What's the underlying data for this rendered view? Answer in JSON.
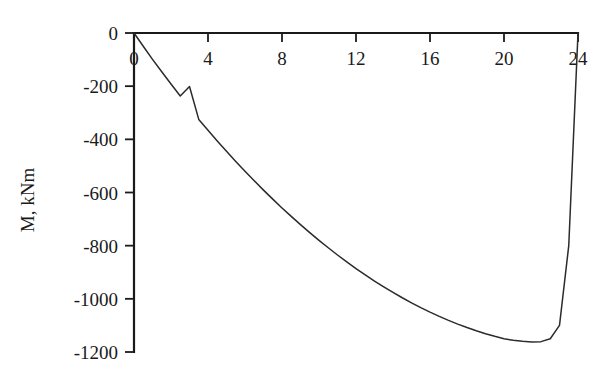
{
  "chart_data": {
    "type": "line",
    "title": "",
    "xlabel": "",
    "ylabel": "M, kNm",
    "xlim": [
      0,
      24
    ],
    "ylim": [
      -1200,
      0
    ],
    "grid": false,
    "legend": null,
    "xticks": [
      "0",
      "4",
      "8",
      "12",
      "16",
      "20",
      "24"
    ],
    "xtick_values": [
      0,
      4,
      8,
      12,
      16,
      20,
      24
    ],
    "yticks": [
      "0",
      "-200",
      "-400",
      "-600",
      "-800",
      "-1000",
      "-1200"
    ],
    "ytick_values": [
      0,
      -200,
      -400,
      -600,
      -800,
      -1000,
      -1200
    ],
    "series": [
      {
        "name": "Bending moment",
        "color": "#2b2b2b",
        "x": [
          0,
          0.5,
          1,
          1.5,
          2,
          2.5,
          3,
          3.5,
          4,
          4.5,
          5,
          5.5,
          6,
          6.5,
          7,
          7.5,
          8,
          8.5,
          9,
          9.5,
          10,
          10.5,
          11,
          11.5,
          12,
          12.5,
          13,
          13.5,
          14,
          14.5,
          15,
          15.5,
          16,
          16.5,
          17,
          17.5,
          18,
          18.5,
          19,
          19.5,
          20,
          20.5,
          21,
          21.5,
          22,
          22.5,
          23,
          23.5,
          24
        ],
        "y": [
          0,
          -50,
          -99,
          -146,
          -192,
          -237,
          -201,
          -325,
          -366,
          -406,
          -445,
          -483,
          -520,
          -556,
          -591,
          -625,
          -658,
          -690,
          -721,
          -751,
          -780,
          -808,
          -835,
          -861,
          -886,
          -910,
          -933,
          -955,
          -976,
          -996,
          -1015,
          -1033,
          -1050,
          -1066,
          -1081,
          -1095,
          -1108,
          -1120,
          -1131,
          -1141,
          -1150,
          -1156,
          -1160,
          -1162,
          -1161,
          -1150,
          -1100,
          -800,
          0
        ]
      }
    ],
    "annotations": [],
    "minimum": {
      "x": 11.5,
      "y": -1162
    }
  },
  "axes": {
    "y_axis_title": "M, kNm",
    "x_axis_position": "top",
    "y_axis_position": "left"
  }
}
